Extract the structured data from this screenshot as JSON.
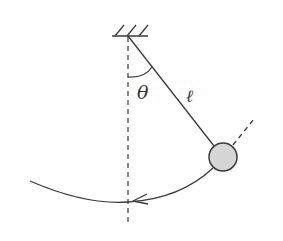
{
  "diagram": {
    "labels": {
      "angle": "θ",
      "length": "ℓ"
    },
    "colors": {
      "stroke": "#3a3a3a",
      "bob_fill": "#d6d6d6",
      "background": "#ffffff"
    },
    "elements": {
      "support": "hatched ceiling support",
      "string": "pendulum string of length ℓ",
      "bob": "shaded circular bob",
      "vertical_reference": "dashed vertical line through pivot",
      "extension": "dashed extension of string beyond bob",
      "arc": "circular path with arrow pointing toward equilibrium",
      "angle_arc": "arc marking angle θ between vertical and string"
    }
  }
}
